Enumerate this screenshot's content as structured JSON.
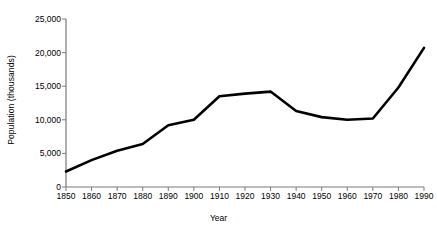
{
  "chart_data": {
    "type": "line",
    "title": "",
    "xlabel": "Year",
    "ylabel": "Population (thousands)",
    "xlim": [
      1850,
      1990
    ],
    "ylim": [
      0,
      25000
    ],
    "grid": false,
    "legend": "none",
    "line_color": "#000000",
    "background_color": "#ffffff",
    "axis_color": "#7a7a7a",
    "xticks": [
      1850,
      1860,
      1870,
      1880,
      1890,
      1900,
      1910,
      1920,
      1930,
      1940,
      1950,
      1960,
      1970,
      1980,
      1990
    ],
    "xtick_labels": [
      "1850",
      "1860",
      "1870",
      "1880",
      "1890",
      "1900",
      "1910",
      "1920",
      "1930",
      "1940",
      "1950",
      "1960",
      "1970",
      "1980",
      "1990"
    ],
    "yticks": [
      0,
      5000,
      10000,
      15000,
      20000,
      25000
    ],
    "ytick_labels": [
      "0",
      "5,000",
      "10,000",
      "15,000",
      "20,000",
      "25,000"
    ],
    "x": [
      1850,
      1860,
      1870,
      1880,
      1890,
      1900,
      1910,
      1920,
      1930,
      1940,
      1950,
      1960,
      1970,
      1980,
      1990
    ],
    "values": [
      2300,
      4000,
      5400,
      6400,
      9200,
      10000,
      13500,
      13900,
      14200,
      11300,
      10400,
      10000,
      10200,
      14800,
      20700
    ],
    "series": [
      {
        "name": "Population",
        "values": [
          2300,
          4000,
          5400,
          6400,
          9200,
          10000,
          13500,
          13900,
          14200,
          11300,
          10400,
          10000,
          10200,
          14800,
          20700
        ]
      }
    ]
  }
}
